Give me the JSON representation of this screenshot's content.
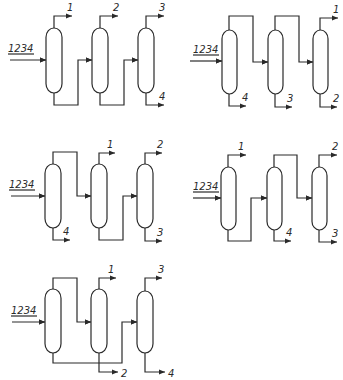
{
  "figure": {
    "line_color": "#2a2a2a",
    "background": "#ffffff"
  },
  "diagrams": [
    {
      "id": "sequence-a",
      "offset": [
        0,
        0
      ],
      "feed": {
        "label": "1234",
        "y": 60,
        "x_start": 10,
        "label_x": 8,
        "label_y": 52
      },
      "columns": [
        {
          "x": 46,
          "top": 28,
          "bottom": 93,
          "w": 16
        },
        {
          "x": 92,
          "top": 28,
          "bottom": 93,
          "w": 16
        },
        {
          "x": 138,
          "top": 28,
          "bottom": 93,
          "w": 16
        }
      ],
      "paths": [
        {
          "name": "col1-bottoms-to-col2",
          "d": "M54,93 L54,105 L78,105 L78,60 L92,60",
          "arrow": [
            92,
            60,
            "right"
          ]
        },
        {
          "name": "col2-bottoms-to-col3",
          "d": "M100,93 L100,105 L124,105 L124,60 L138,60",
          "arrow": [
            138,
            60,
            "right"
          ]
        }
      ],
      "products": [
        {
          "label": "1",
          "d": "M54,28 L54,16 L72,16",
          "arrow": [
            72,
            16,
            "right"
          ],
          "lx": 67,
          "ly": 11
        },
        {
          "label": "2",
          "d": "M100,28 L100,16 L118,16",
          "arrow": [
            118,
            16,
            "right"
          ],
          "lx": 113,
          "ly": 11
        },
        {
          "label": "3",
          "d": "M146,28 L146,16 L164,16",
          "arrow": [
            164,
            16,
            "right"
          ],
          "lx": 159,
          "ly": 11
        },
        {
          "label": "4",
          "d": "M146,93 L146,105 L164,105",
          "arrow": [
            164,
            105,
            "right"
          ],
          "lx": 159,
          "ly": 100
        }
      ]
    },
    {
      "id": "sequence-b",
      "offset": [
        0,
        0
      ],
      "feed": {
        "label": "1234",
        "y": 61,
        "x_start": 190,
        "label_x": 193,
        "label_y": 53
      },
      "columns": [
        {
          "x": 222,
          "top": 30,
          "bottom": 94,
          "w": 15
        },
        {
          "x": 268,
          "top": 30,
          "bottom": 94,
          "w": 15
        },
        {
          "x": 313,
          "top": 30,
          "bottom": 94,
          "w": 15
        }
      ],
      "paths": [
        {
          "name": "col1-tops-to-col2",
          "d": "M229,30 L229,16 L253,16 L253,62 L268,62",
          "arrow": [
            268,
            62,
            "right"
          ]
        },
        {
          "name": "col2-tops-to-col3",
          "d": "M275,30 L275,16 L299,16 L299,62 L313,62",
          "arrow": [
            313,
            62,
            "right"
          ]
        }
      ],
      "products": [
        {
          "label": "1",
          "d": "M320,30 L320,18 L338,18",
          "arrow": [
            338,
            18,
            "right"
          ],
          "lx": 333,
          "ly": 13
        },
        {
          "label": "4",
          "d": "M229,94 L229,106 L246,106",
          "arrow": [
            246,
            106,
            "right"
          ],
          "lx": 242,
          "ly": 101
        },
        {
          "label": "3",
          "d": "M275,94 L275,107 L292,107",
          "arrow": [
            292,
            107,
            "right"
          ],
          "lx": 287,
          "ly": 102
        },
        {
          "label": "2",
          "d": "M320,94 L320,107 L337,107",
          "arrow": [
            337,
            107,
            "right"
          ],
          "lx": 333,
          "ly": 102
        }
      ]
    },
    {
      "id": "sequence-c",
      "offset": [
        0,
        0
      ],
      "feed": {
        "label": "1234",
        "y": 196,
        "x_start": 11,
        "label_x": 9,
        "label_y": 188
      },
      "columns": [
        {
          "x": 45,
          "top": 164,
          "bottom": 228,
          "w": 16
        },
        {
          "x": 91,
          "top": 164,
          "bottom": 228,
          "w": 16
        },
        {
          "x": 137,
          "top": 164,
          "bottom": 228,
          "w": 16
        }
      ],
      "paths": [
        {
          "name": "col1-tops-to-col2",
          "d": "M53,164 L53,152 L77,152 L77,196 L91,196",
          "arrow": [
            91,
            196,
            "right"
          ]
        },
        {
          "name": "col2-bottoms-to-col3",
          "d": "M99,228 L99,240 L123,240 L123,196 L137,196",
          "arrow": [
            137,
            196,
            "right"
          ]
        }
      ],
      "products": [
        {
          "label": "1",
          "d": "M99,164 L99,153 L115,153",
          "arrow": [
            115,
            153,
            "right"
          ],
          "lx": 107,
          "ly": 148
        },
        {
          "label": "2",
          "d": "M145,164 L145,153 L162,153",
          "arrow": [
            162,
            153,
            "right"
          ],
          "lx": 157,
          "ly": 148
        },
        {
          "label": "4",
          "d": "M53,228 L53,240 L70,240",
          "arrow": [
            70,
            240,
            "right"
          ],
          "lx": 63,
          "ly": 235
        },
        {
          "label": "3",
          "d": "M145,228 L145,241 L162,241",
          "arrow": [
            162,
            241,
            "right"
          ],
          "lx": 157,
          "ly": 236
        }
      ]
    },
    {
      "id": "sequence-d",
      "offset": [
        0,
        0
      ],
      "feed": {
        "label": "1234",
        "y": 198,
        "x_start": 193,
        "label_x": 193,
        "label_y": 190
      },
      "columns": [
        {
          "x": 221,
          "top": 167,
          "bottom": 230,
          "w": 15
        },
        {
          "x": 267,
          "top": 167,
          "bottom": 230,
          "w": 15
        },
        {
          "x": 312,
          "top": 167,
          "bottom": 230,
          "w": 15
        }
      ],
      "paths": [
        {
          "name": "col1-bottoms-to-col2",
          "d": "M228,230 L228,241 L251,241 L251,198 L267,198",
          "arrow": [
            267,
            198,
            "right"
          ]
        },
        {
          "name": "col2-tops-to-col3",
          "d": "M274,167 L274,155 L297,155 L297,198 L312,198",
          "arrow": [
            312,
            198,
            "right"
          ]
        }
      ],
      "products": [
        {
          "label": "1",
          "d": "M228,167 L228,155 L246,155",
          "arrow": [
            246,
            155,
            "right"
          ],
          "lx": 238,
          "ly": 150
        },
        {
          "label": "2",
          "d": "M319,167 L319,155 L337,155",
          "arrow": [
            337,
            155,
            "right"
          ],
          "lx": 332,
          "ly": 150
        },
        {
          "label": "4",
          "d": "M274,230 L274,241 L291,241",
          "arrow": [
            291,
            241,
            "right"
          ],
          "lx": 286,
          "ly": 236
        },
        {
          "label": "3",
          "d": "M319,230 L319,242 L337,242",
          "arrow": [
            337,
            242,
            "right"
          ],
          "lx": 332,
          "ly": 237
        }
      ]
    },
    {
      "id": "sequence-e",
      "offset": [
        0,
        0
      ],
      "feed": {
        "label": "1234",
        "y": 322,
        "x_start": 12,
        "label_x": 11,
        "label_y": 314
      },
      "columns": [
        {
          "x": 45,
          "top": 289,
          "bottom": 353,
          "w": 16
        },
        {
          "x": 91,
          "top": 289,
          "bottom": 353,
          "w": 16
        },
        {
          "x": 137,
          "top": 291,
          "bottom": 353,
          "w": 16
        }
      ],
      "paths": [
        {
          "name": "col1-tops-to-col2",
          "d": "M53,289 L53,278 L77,278 L77,322 L91,322",
          "arrow": [
            91,
            322,
            "right"
          ]
        },
        {
          "name": "col1-bottoms-to-col3",
          "d": "M53,353 L53,363 L122,363 L122,322 L137,322",
          "arrow": [
            137,
            322,
            "right"
          ]
        }
      ],
      "products": [
        {
          "label": "1",
          "d": "M99,289 L99,278 L116,278",
          "arrow": [
            116,
            278,
            "right"
          ],
          "lx": 108,
          "ly": 273
        },
        {
          "label": "2",
          "d": "M99,353 L99,372 L118,372",
          "arrow": [
            118,
            372,
            "right"
          ],
          "lx": 121,
          "ly": 377
        },
        {
          "label": "3",
          "d": "M145,291 L145,278 L162,278",
          "arrow": [
            162,
            278,
            "right"
          ],
          "lx": 158,
          "ly": 273
        },
        {
          "label": "4",
          "d": "M145,353 L145,372 L165,372",
          "arrow": [
            165,
            372,
            "right"
          ],
          "lx": 168,
          "ly": 377
        }
      ]
    }
  ]
}
